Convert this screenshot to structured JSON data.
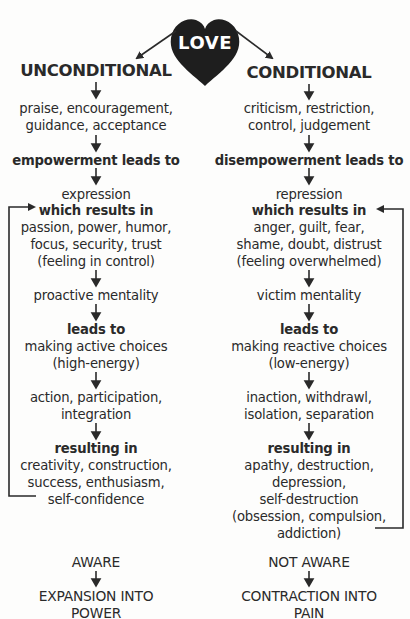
{
  "center": {
    "label": "LOVE",
    "icon": "heart-icon",
    "color": "#1e1e1e"
  },
  "left": {
    "title": "UNCONDITIONAL",
    "lines": [
      "praise, encouragement,",
      "guidance, acceptance",
      "empowerment leads to",
      "expression",
      "which results in",
      "passion, power, humor,",
      "focus, security, trust",
      "(feeling in control)",
      "proactive mentality",
      "leads to",
      "making active choices",
      "(high-energy)",
      "action, participation,",
      "integration",
      "resulting in",
      "creativity, construction,",
      "success, enthusiasm,",
      "self-confidence"
    ],
    "outcome": {
      "state": "AWARE",
      "result_line1": "EXPANSION INTO",
      "result_line2": "POWER"
    }
  },
  "right": {
    "title": "CONDITIONAL",
    "lines": [
      "criticism, restriction,",
      "control, judgement",
      "disempowerment leads to",
      "repression",
      "which results in",
      "anger, guilt, fear,",
      "shame, doubt, distrust",
      "(feeling overwhelmed)",
      "victim mentality",
      "leads to",
      "making reactive choices",
      "(low-energy)",
      "inaction, withdrawl,",
      "isolation, separation",
      "resulting in",
      "apathy, destruction,",
      "depression,",
      "self-destruction",
      "(obsession, compulsion,",
      "addiction)"
    ],
    "outcome": {
      "state": "NOT AWARE",
      "result_line1": "CONTRACTION INTO",
      "result_line2": "PAIN"
    }
  },
  "colors": {
    "ink": "#2a2a2a",
    "background": "#fdfdfc"
  }
}
